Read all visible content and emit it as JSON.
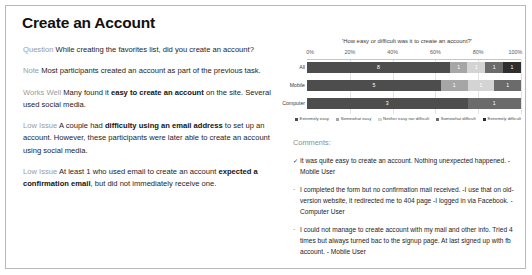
{
  "page_title": "Create an Account",
  "left": {
    "blocks": [
      {
        "tag": "Question",
        "text": "While creating the favorites list, did you create an account?",
        "bold": ""
      },
      {
        "tag": "Note",
        "text": "Most participants created an account as part of the previous task.",
        "bold": ""
      },
      {
        "tag": "Works Well",
        "text_before": "Many found it ",
        "bold": "easy to create an account",
        "text_after": " on the site. Several used social media."
      },
      {
        "tag": "Low Issue",
        "text_before": "A couple had ",
        "bold": "difficulty using an email address",
        "text_after": " to set up an account. However, these participants were later able to create an account using social media."
      },
      {
        "tag": "Low Issue",
        "text_before": "At least 1 who used email to create an account ",
        "bold": "expected a confirmation email",
        "text_after": ", but did not immediately receive one."
      }
    ]
  },
  "chart_data": {
    "type": "bar",
    "orientation": "horizontal",
    "stacked": true,
    "stacked_percent": true,
    "title": "'How easy or difficult was it to create an account?'",
    "xlabel": "",
    "ylabel": "",
    "xlim": [
      0,
      100
    ],
    "xticks": [
      "0%",
      "20%",
      "40%",
      "60%",
      "80%",
      "100%"
    ],
    "xtick_values": [
      0,
      20,
      40,
      60,
      80,
      100
    ],
    "grid": true,
    "legend_position": "bottom",
    "categories": [
      "All",
      "Mobile",
      "Computer"
    ],
    "series": [
      {
        "name": "Extremely easy",
        "color": "#4d4d4d",
        "values": [
          8,
          5,
          3
        ],
        "labels": [
          "8",
          "5",
          "3"
        ]
      },
      {
        "name": "Somewhat easy",
        "color": "#a6a6a6",
        "values": [
          1,
          1,
          0
        ],
        "labels": [
          "1",
          "1",
          ""
        ]
      },
      {
        "name": "Neither easy nor difficult",
        "color": "#d4d4d4",
        "values": [
          1,
          1,
          0
        ],
        "labels": [
          "1",
          "1",
          ""
        ]
      },
      {
        "name": "Somewhat difficult",
        "color": "#6b6b6b",
        "values": [
          1,
          1,
          1
        ],
        "labels": [
          "1",
          "1",
          "1"
        ]
      },
      {
        "name": "Extremely difficult",
        "color": "#2e2e2e",
        "values": [
          1,
          0,
          0
        ],
        "labels": [
          "1",
          "",
          ""
        ]
      }
    ]
  },
  "comments": {
    "heading": "Comments:",
    "items": [
      {
        "mark": "✓",
        "text": "It was quite easy to create an account. Nothing unexpected happened. - Mobile User"
      },
      {
        "mark": "·",
        "text": "I completed the form but no confirmation mail received. -I use that on old-version website, it redirected me to 404 page -I logged in via Facebook. - Computer User"
      },
      {
        "mark": "·",
        "text": "I could not manage to create account with my mail and other info. Tried 4 times but always turned bac to the signup page. At last signed up with fb account. - Mobile User"
      }
    ]
  }
}
